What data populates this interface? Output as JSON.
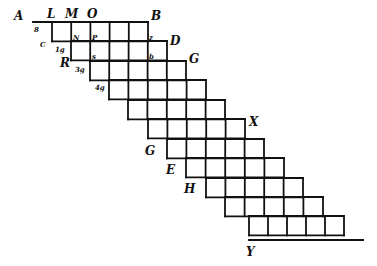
{
  "figure": {
    "ink_color": "#111111",
    "background": "#ffffff",
    "cell_size": 19.3,
    "rows": [
      {
        "top": 22,
        "left": 52,
        "right": 148
      },
      {
        "top": 41,
        "left": 71,
        "right": 167
      },
      {
        "top": 61,
        "left": 90,
        "right": 186
      },
      {
        "top": 80,
        "left": 109,
        "right": 206
      },
      {
        "top": 100,
        "left": 128,
        "right": 225
      },
      {
        "top": 119,
        "left": 148,
        "right": 245
      },
      {
        "top": 139,
        "left": 167,
        "right": 264
      },
      {
        "top": 158,
        "left": 186,
        "right": 284
      },
      {
        "top": 178,
        "left": 206,
        "right": 303
      },
      {
        "top": 197,
        "left": 225,
        "right": 323
      },
      {
        "top": 216,
        "left": 249,
        "right": 344
      }
    ],
    "top_line": {
      "x1": 33,
      "x2": 148,
      "y": 22
    },
    "base_line": {
      "x1": 249,
      "x2": 363,
      "y": 240
    },
    "labels": [
      {
        "text": "A",
        "x": 14,
        "y": 20,
        "size": "big"
      },
      {
        "text": "L",
        "x": 47,
        "y": 18,
        "size": "big"
      },
      {
        "text": "M",
        "x": 65,
        "y": 18,
        "size": "big"
      },
      {
        "text": "O",
        "x": 87,
        "y": 18,
        "size": "big"
      },
      {
        "text": "B",
        "x": 151,
        "y": 20,
        "size": "big"
      },
      {
        "text": "D",
        "x": 170,
        "y": 45,
        "size": "big"
      },
      {
        "text": "G",
        "x": 189,
        "y": 63,
        "size": "big"
      },
      {
        "text": "X",
        "x": 249,
        "y": 126,
        "size": "big"
      },
      {
        "text": "G",
        "x": 145,
        "y": 155,
        "size": "big"
      },
      {
        "text": "E",
        "x": 166,
        "y": 174,
        "size": "big"
      },
      {
        "text": "H",
        "x": 184,
        "y": 193,
        "size": "big"
      },
      {
        "text": "Y",
        "x": 246,
        "y": 256,
        "size": "big"
      },
      {
        "text": "R",
        "x": 60,
        "y": 67,
        "size": "big"
      },
      {
        "text": "C",
        "x": 40,
        "y": 47,
        "size": "small"
      },
      {
        "text": "8",
        "x": 34,
        "y": 32,
        "size": "small"
      },
      {
        "text": "1g",
        "x": 55,
        "y": 52,
        "size": "small"
      },
      {
        "text": "3g",
        "x": 75,
        "y": 72,
        "size": "small"
      },
      {
        "text": "4g",
        "x": 95,
        "y": 90,
        "size": "small"
      },
      {
        "text": "N",
        "x": 73,
        "y": 40,
        "size": "small"
      },
      {
        "text": "P",
        "x": 92,
        "y": 40,
        "size": "small"
      },
      {
        "text": "s",
        "x": 92,
        "y": 59,
        "size": "small"
      },
      {
        "text": "z",
        "x": 149,
        "y": 40,
        "size": "small"
      },
      {
        "text": "b",
        "x": 149,
        "y": 59,
        "size": "small"
      }
    ]
  }
}
